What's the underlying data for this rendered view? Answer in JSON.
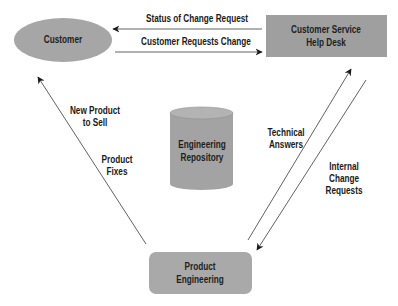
{
  "nodes": {
    "customer": {
      "label": "Customer",
      "shape": "ellipse",
      "fill": "#a6a6a6"
    },
    "help_desk": {
      "line1": "Customer Service",
      "line2": "Help Desk",
      "shape": "rectangle",
      "fill": "#9f9f9f"
    },
    "repository": {
      "line1": "Engineering",
      "line2": "Repository",
      "shape": "cylinder",
      "fill": "#a3a3a3"
    },
    "product_engineering": {
      "line1": "Product",
      "line2": "Engineering",
      "shape": "rounded-rectangle",
      "fill": "#a9a9a9"
    }
  },
  "edges": {
    "status_of_change_request": {
      "label": "Status of Change Request",
      "from": "help_desk",
      "to": "customer"
    },
    "customer_requests_change": {
      "label": "Customer Requests Change",
      "from": "customer",
      "to": "help_desk"
    },
    "new_product_to_sell": {
      "line1": "New Product",
      "line2": "to Sell",
      "from": "product_engineering",
      "to": "customer"
    },
    "product_fixes": {
      "line1": "Product",
      "line2": "Fixes",
      "from": "product_engineering",
      "to": "customer"
    },
    "technical_answers": {
      "line1": "Technical",
      "line2": "Answers",
      "from": "product_engineering",
      "to": "help_desk"
    },
    "internal_change_requests": {
      "line1": "Internal",
      "line2": "Change",
      "line3": "Requests",
      "from": "help_desk",
      "to": "product_engineering"
    }
  },
  "colors": {
    "line": "#3a3a3a",
    "arrowhead": "#1a1a1a",
    "text": "#1a1a1a"
  }
}
